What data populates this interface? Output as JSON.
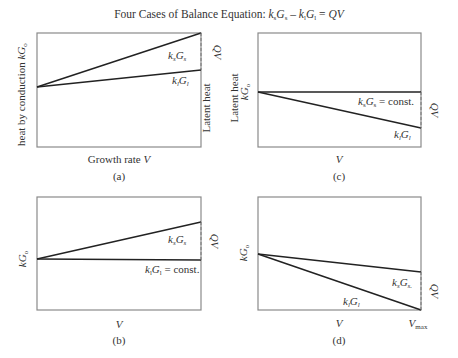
{
  "title": {
    "prefix": "Four Cases of Balance Equation: ",
    "k_s": "k",
    "s_sub": "s",
    "G_s": "G",
    "gs_sub": "s",
    "minus": " – ",
    "k_l": "k",
    "l_sub": "l",
    "G_l": "G",
    "gl_sub": "l",
    "eq": " = ",
    "rhs": "QV"
  },
  "panels": {
    "a": {
      "caption": "(a)",
      "ylabel": "heat by conduction kG",
      "ylabel_k": "heat by conduction ",
      "ylabel_kG": "kG",
      "ylabel_sub": "o",
      "xlabel_prefix": "Growth rate ",
      "xlabel_var": "V",
      "right_label_top": "QV",
      "right_label_bottom": "Latent heat",
      "line_upper": "ksGs",
      "line_lower": "klGl"
    },
    "b": {
      "caption": "(b)",
      "ylabel_kG": "kG",
      "ylabel_sub": "o",
      "xlabel_var": "V",
      "right_label": "QV",
      "line_upper": "ksGs",
      "line_lower": "klGl = const.",
      "const": " = const."
    },
    "c": {
      "caption": "(c)",
      "ylabel_kG": "kG",
      "ylabel_sub": "o",
      "xlabel_var": "V",
      "right_label": "QV",
      "line_upper": "ksGs = const.",
      "line_lower": "klGl",
      "const": " = const."
    },
    "d": {
      "caption": "(d)",
      "ylabel_kG": "kG",
      "ylabel_sub": "o",
      "xlabel_var": "V",
      "xlabel_vmax": "V",
      "vmax_sub": "max",
      "right_label": "QV",
      "line_upper": "ksGs",
      "line_lower": "klGl"
    }
  },
  "colors": {
    "frame": "#8a8a8a",
    "line": "#222222",
    "dash": "#777777",
    "text": "#333333"
  }
}
